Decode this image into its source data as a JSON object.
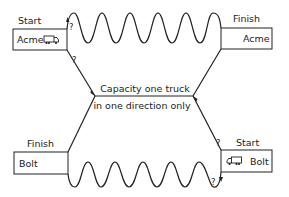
{
  "diagram": {
    "type": "road-deadlock",
    "top_left": {
      "role_label": "Start",
      "company": "Acme",
      "icon": "truck-icon"
    },
    "top_right": {
      "role_label": "Finish",
      "company": "Acme"
    },
    "bottom_left": {
      "role_label": "Finish",
      "company": "Bolt"
    },
    "bottom_right": {
      "role_label": "Start",
      "company": "Bolt",
      "icon": "truck-icon"
    },
    "center_caption": {
      "line1": "Capacity one truck",
      "line2": "in one direction only"
    },
    "question_marks": [
      "?",
      "?",
      "?",
      "?"
    ],
    "stroke_color": "#222222",
    "background_color": "#ffffff"
  }
}
